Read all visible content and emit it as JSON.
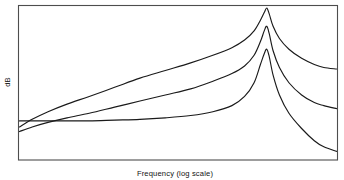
{
  "chart_data": {
    "type": "line",
    "title": "",
    "subtitle": "",
    "xlabel": "Frequency (log scale)",
    "ylabel": "dB",
    "grid": false,
    "legend": null,
    "legend_position": "none",
    "axis_ticks": {
      "x": [],
      "y": []
    },
    "x_scale": "log",
    "y_scale": "linear",
    "xlim": [
      0,
      100
    ],
    "ylim": [
      0,
      100
    ],
    "annotations": [],
    "series": [
      {
        "name": "Low damping (high Q)",
        "peak_x": 78,
        "peak_y": 99,
        "start_y": 21,
        "end_y": 59,
        "x": [
          0,
          4,
          9,
          15,
          22,
          30,
          38,
          46,
          54,
          61,
          67,
          71,
          74,
          76,
          77.2,
          78,
          78.8,
          80,
          82,
          85,
          89,
          93,
          96,
          100
        ],
        "y": [
          21,
          26,
          31,
          36,
          41,
          47,
          53,
          58,
          63,
          68,
          73,
          78,
          84,
          91,
          96,
          99,
          95,
          87,
          79,
          72,
          66,
          62,
          60,
          59
        ]
      },
      {
        "name": "Medium damping",
        "peak_x": 78,
        "peak_y": 87,
        "start_y": 18,
        "end_y": 33,
        "x": [
          0,
          4,
          9,
          15,
          22,
          30,
          38,
          46,
          54,
          61,
          67,
          71,
          74,
          76,
          77.2,
          78,
          78.8,
          80,
          82,
          85,
          89,
          93,
          96,
          100
        ],
        "y": [
          18,
          21,
          24,
          27,
          30,
          34,
          38,
          42,
          46,
          51,
          56,
          61,
          68,
          77,
          84,
          87,
          82,
          71,
          60,
          50,
          42,
          37,
          35,
          33
        ]
      },
      {
        "name": "High damping (low Q)",
        "peak_x": 78,
        "peak_y": 72,
        "start_y": 25,
        "end_y": 5,
        "x": [
          0,
          4,
          9,
          15,
          22,
          30,
          38,
          46,
          54,
          61,
          67,
          71,
          74,
          76,
          77.2,
          78,
          78.8,
          80,
          82,
          85,
          89,
          93,
          96,
          100
        ],
        "y": [
          25,
          25,
          25,
          25,
          25,
          25.5,
          26,
          27,
          28.5,
          31,
          35,
          41,
          50,
          62,
          69,
          72,
          67,
          55,
          42,
          30,
          20,
          12,
          8,
          5
        ]
      }
    ]
  },
  "figure": {
    "frame_color": "#4d4d4d",
    "curve_color": "#1a1a1a",
    "background": "#ffffff"
  }
}
